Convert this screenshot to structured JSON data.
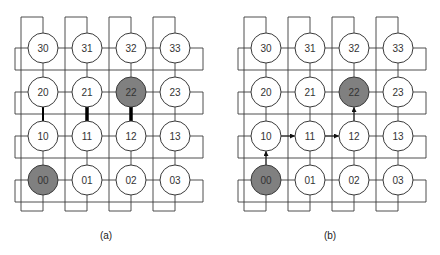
{
  "diagram": {
    "type": "4x4 torus network (2D mesh with wraparound links)",
    "grid": {
      "rows": 4,
      "cols": 4,
      "row_order_top_to_bottom": [
        "3",
        "2",
        "1",
        "0"
      ],
      "node_labels": [
        [
          "30",
          "31",
          "32",
          "33"
        ],
        [
          "20",
          "21",
          "22",
          "23"
        ],
        [
          "10",
          "11",
          "12",
          "13"
        ],
        [
          "00",
          "01",
          "02",
          "03"
        ]
      ]
    },
    "colors": {
      "node_fill": "#ffffff",
      "highlight_fill": "#808080",
      "stroke": "#3a3a3a",
      "text": "#333333"
    },
    "panels": [
      {
        "id": "a",
        "caption": "(a)",
        "highlighted_nodes": [
          "22",
          "00"
        ],
        "thick_links": [
          {
            "from": "20",
            "to": "10",
            "weight": 2
          },
          {
            "from": "21",
            "to": "11",
            "weight": 3.5
          },
          {
            "from": "22",
            "to": "12",
            "weight": 3.5
          }
        ],
        "arrows": []
      },
      {
        "id": "b",
        "caption": "(b)",
        "highlighted_nodes": [
          "22",
          "00"
        ],
        "thick_links": [],
        "arrows": [
          {
            "from": "00",
            "to": "10"
          },
          {
            "from": "10",
            "to": "11"
          },
          {
            "from": "11",
            "to": "12"
          },
          {
            "from": "12",
            "to": "22"
          }
        ]
      }
    ]
  },
  "layout": {
    "panel_col_x": [
      [
        43,
        87,
        131,
        175
      ],
      [
        266,
        310,
        354,
        398
      ]
    ],
    "row_y": [
      48,
      92,
      136,
      180
    ],
    "radius": 15,
    "caption_y": 235,
    "caption_x": [
      106,
      330
    ]
  }
}
